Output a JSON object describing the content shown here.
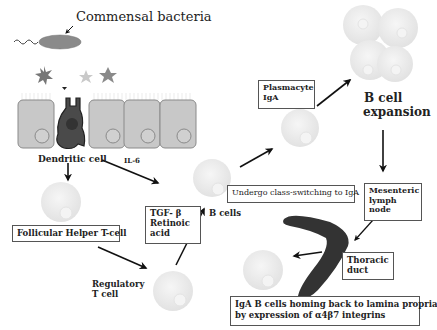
{
  "diagram": {
    "title_label": "Commensal bacteria",
    "labels": {
      "dendritic_cell": "Dendritic cell",
      "il6": "IL-6",
      "follicular_helper": "Follicular Helper T-cell",
      "regulatory_line1": "Regulatory",
      "regulatory_line2": "T cell",
      "tgf_line1": "TGF- β",
      "tgf_line2": "Retinoic",
      "tgf_line3": "acid",
      "b_cells": "B cells",
      "class_switch": "Undergo class-switching to IgA",
      "plasmacyte_line1": "Plasmacyte",
      "plasmacyte_line2": "IgA",
      "b_expansion_line1": "B cell",
      "b_expansion_line2": "expansion",
      "mesenteric_line1": "Mesenteric",
      "mesenteric_line2": "lymph",
      "mesenteric_line3": "node",
      "thoracic_line1": "Thoracic",
      "thoracic_line2": "duct",
      "homing_line1": "IgA B cells homing back to lamina propria",
      "homing_line2": "by expression of α4β7 integrins"
    },
    "colors": {
      "epithelium_fill": "#c8c8c8",
      "epithelium_stroke": "#8a8a8a",
      "dendritic_fill": "#4a4a4a",
      "bacteria_fill": "#8a8a8a",
      "cell_fill": "#ececec",
      "duct_fill": "#3a3a3a",
      "arrow": "#111111"
    }
  }
}
